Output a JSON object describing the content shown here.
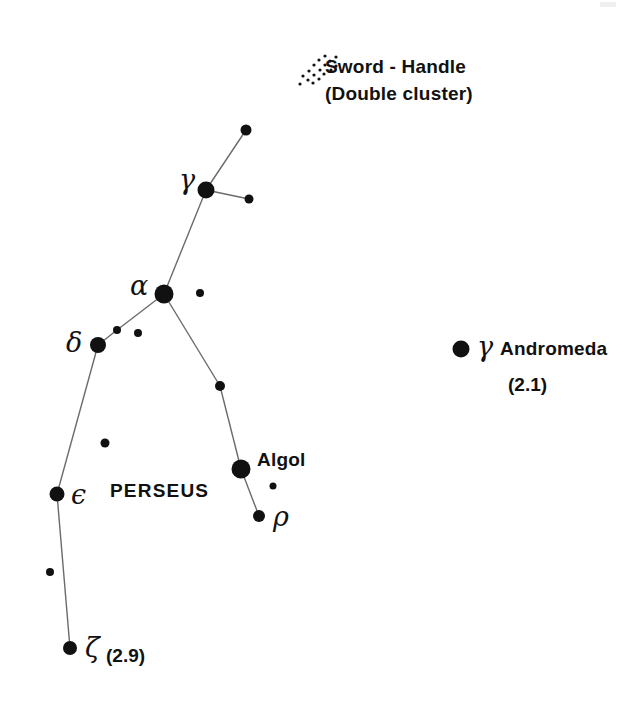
{
  "chart_data": {
    "type": "scatter",
    "xlabel": "",
    "ylabel": "",
    "xlim": [
      0,
      642
    ],
    "ylim": [
      0,
      701
    ],
    "grid": false,
    "legend": "none",
    "stars": [
      {
        "name": "perseus-upper-star",
        "x": 246,
        "y": 130,
        "r": 5.5,
        "label": ""
      },
      {
        "name": "gamma-persei",
        "x": 206,
        "y": 190,
        "r": 8.5,
        "label": "gamma"
      },
      {
        "name": "gamma-companion",
        "x": 249,
        "y": 199,
        "r": 4.5,
        "label": ""
      },
      {
        "name": "alpha-persei",
        "x": 164,
        "y": 294,
        "r": 9.5,
        "label": "alpha"
      },
      {
        "name": "alpha-companion",
        "x": 200,
        "y": 293,
        "r": 4.0,
        "label": ""
      },
      {
        "name": "delta-companion-near",
        "x": 117,
        "y": 330,
        "r": 4.0,
        "label": ""
      },
      {
        "name": "delta-companion-far",
        "x": 138,
        "y": 333,
        "r": 4.0,
        "label": ""
      },
      {
        "name": "delta-persei",
        "x": 98,
        "y": 345,
        "r": 8.0,
        "label": "delta"
      },
      {
        "name": "kappa-persei",
        "x": 220,
        "y": 386,
        "r": 5.0,
        "label": ""
      },
      {
        "name": "field-star-mid",
        "x": 105,
        "y": 443,
        "r": 4.5,
        "label": ""
      },
      {
        "name": "algol",
        "x": 241,
        "y": 469,
        "r": 9.5,
        "label": "Algol"
      },
      {
        "name": "algol-companion",
        "x": 273,
        "y": 486,
        "r": 3.5,
        "label": ""
      },
      {
        "name": "epsilon-persei",
        "x": 57,
        "y": 494,
        "r": 7.5,
        "label": "epsilon"
      },
      {
        "name": "rho-persei",
        "x": 259,
        "y": 516,
        "r": 6.0,
        "label": "rho"
      },
      {
        "name": "field-star-lower",
        "x": 50,
        "y": 572,
        "r": 4.0,
        "label": ""
      },
      {
        "name": "zeta-persei",
        "x": 70,
        "y": 648,
        "r": 7.0,
        "label": "zeta"
      },
      {
        "name": "gamma-andromedae",
        "x": 461,
        "y": 349,
        "r": 8.5,
        "label": "gamma"
      }
    ],
    "lines": [
      {
        "name": "line-upper-to-gamma",
        "x1": 246,
        "y1": 130,
        "x2": 206,
        "y2": 190
      },
      {
        "name": "line-gamma-to-companion",
        "x1": 206,
        "y1": 190,
        "x2": 249,
        "y2": 199
      },
      {
        "name": "line-gamma-to-alpha",
        "x1": 206,
        "y1": 190,
        "x2": 164,
        "y2": 294
      },
      {
        "name": "line-alpha-to-delta-chain",
        "x1": 164,
        "y1": 294,
        "x2": 117,
        "y2": 330
      },
      {
        "name": "line-alpha-to-kappa",
        "x1": 164,
        "y1": 294,
        "x2": 220,
        "y2": 386
      },
      {
        "name": "line-delta-to-companion",
        "x1": 98,
        "y1": 345,
        "x2": 117,
        "y2": 330
      },
      {
        "name": "line-delta-to-epsilon",
        "x1": 98,
        "y1": 345,
        "x2": 57,
        "y2": 494
      },
      {
        "name": "line-kappa-to-algol",
        "x1": 220,
        "y1": 386,
        "x2": 241,
        "y2": 469
      },
      {
        "name": "line-algol-to-rho",
        "x1": 241,
        "y1": 469,
        "x2": 259,
        "y2": 516
      },
      {
        "name": "line-epsilon-to-zeta",
        "x1": 57,
        "y1": 494,
        "x2": 70,
        "y2": 648
      }
    ],
    "cluster": {
      "name": "sword-handle-double-cluster",
      "dots": [
        {
          "x": 303,
          "y": 76
        },
        {
          "x": 309,
          "y": 71
        },
        {
          "x": 308,
          "y": 80
        },
        {
          "x": 314,
          "y": 65
        },
        {
          "x": 314,
          "y": 75
        },
        {
          "x": 313,
          "y": 83
        },
        {
          "x": 319,
          "y": 60
        },
        {
          "x": 320,
          "y": 70
        },
        {
          "x": 319,
          "y": 79
        },
        {
          "x": 325,
          "y": 56
        },
        {
          "x": 325,
          "y": 65
        },
        {
          "x": 324,
          "y": 74
        },
        {
          "x": 330,
          "y": 61
        },
        {
          "x": 331,
          "y": 70
        },
        {
          "x": 336,
          "y": 57
        },
        {
          "x": 300,
          "y": 84
        },
        {
          "x": 336,
          "y": 66
        }
      ],
      "dot_size": 3.2
    }
  },
  "labels": {
    "sword_handle_line1": "Sword - Handle",
    "sword_handle_line2": "(Double cluster)",
    "gamma_persei": "γ",
    "alpha_persei": "α",
    "delta_persei": "δ",
    "epsilon_persei": "ϵ",
    "zeta_persei": "ζ",
    "zeta_magnitude": "(2.9)",
    "rho_persei": "ρ",
    "algol": "Algol",
    "constellation_name": "PERSEUS",
    "gamma_andromedae_symbol": "γ",
    "gamma_andromedae_name": "Andromeda",
    "gamma_andromedae_magnitude": "(2.1)"
  },
  "colors": {
    "background": "#ffffff",
    "star": "#111111",
    "line": "#6b6b6b",
    "text": "#111111"
  }
}
